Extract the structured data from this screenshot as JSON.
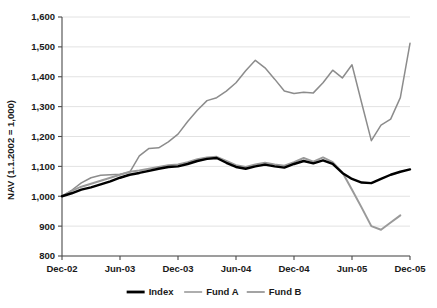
{
  "chart_data": {
    "type": "line",
    "title": "",
    "xlabel": "",
    "ylabel": "NAV (1.1.2002 = 1,000)",
    "ylim": [
      800,
      1600
    ],
    "ytick_labels": [
      "800",
      "900",
      "1,000",
      "1,100",
      "1,200",
      "1,300",
      "1,400",
      "1,500",
      "1,600"
    ],
    "ytick_values": [
      800,
      900,
      1000,
      1100,
      1200,
      1300,
      1400,
      1500,
      1600
    ],
    "xtick_labels": [
      "Dec-02",
      "Jun-03",
      "Dec-03",
      "Jun-04",
      "Dec-04",
      "Jun-05",
      "Dec-05"
    ],
    "xtick_values": [
      0,
      6,
      12,
      18,
      24,
      30,
      36
    ],
    "xlim": [
      0,
      36
    ],
    "grid": "horizontal",
    "legend_position": "bottom-center",
    "x": [
      0,
      1,
      2,
      3,
      4,
      5,
      6,
      7,
      8,
      9,
      10,
      11,
      12,
      13,
      14,
      15,
      16,
      17,
      18,
      19,
      20,
      21,
      22,
      23,
      24,
      25,
      26,
      27,
      28,
      29,
      30,
      31,
      32,
      33,
      34,
      35,
      36
    ],
    "series": [
      {
        "name": "Index",
        "color": "#000000",
        "width": 2.4,
        "values": [
          1000,
          1010,
          1022,
          1030,
          1040,
          1050,
          1062,
          1072,
          1078,
          1085,
          1092,
          1098,
          1100,
          1108,
          1118,
          1125,
          1128,
          1112,
          1098,
          1092,
          1100,
          1106,
          1100,
          1096,
          1108,
          1118,
          1110,
          1120,
          1108,
          1078,
          1058,
          1046,
          1044,
          1058,
          1072,
          1082,
          1090
        ]
      },
      {
        "name": "Fund A",
        "color": "#9a9a9a",
        "width": 2.0,
        "values": [
          1000,
          1018,
          1032,
          1042,
          1052,
          1062,
          1072,
          1082,
          1086,
          1092,
          1098,
          1104,
          1106,
          1114,
          1124,
          1130,
          1132,
          1118,
          1104,
          1098,
          1106,
          1112,
          1106,
          1102,
          1114,
          1128,
          1116,
          1130,
          1114,
          1080,
          1022,
          962,
          900,
          888,
          912,
          936,
          null
        ]
      },
      {
        "name": "Fund B",
        "color": "#8c8c8c",
        "width": 1.5,
        "values": [
          1000,
          1020,
          1045,
          1062,
          1070,
          1072,
          1074,
          1080,
          1135,
          1160,
          1162,
          1182,
          1208,
          1250,
          1288,
          1320,
          1330,
          1352,
          1380,
          1420,
          1455,
          1430,
          1392,
          1352,
          1344,
          1348,
          1346,
          1380,
          1422,
          1396,
          1440,
          1312,
          1186,
          1238,
          1258,
          1330,
          1512
        ]
      }
    ]
  },
  "legend": {
    "items": [
      {
        "label": "Index",
        "color": "#000000"
      },
      {
        "label": "Fund A",
        "color": "#9a9a9a"
      },
      {
        "label": "Fund B",
        "color": "#8c8c8c"
      }
    ]
  },
  "colors": {
    "grid": "#e2e2e2",
    "axis": "#4a4a4a",
    "text": "#1a1a1a",
    "background": "#ffffff"
  }
}
